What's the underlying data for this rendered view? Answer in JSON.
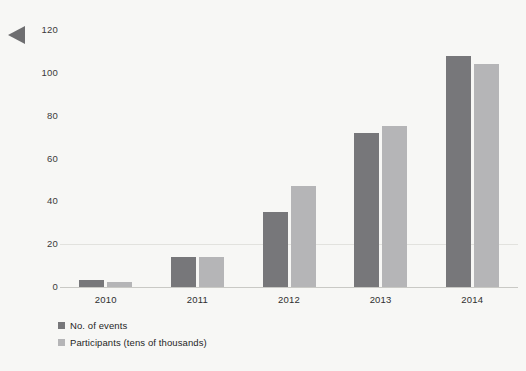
{
  "nav": {
    "prev_arrow_icon": "triangle-left-icon"
  },
  "chart_data": {
    "type": "bar",
    "title": "",
    "subtitle": "",
    "xlabel": "",
    "ylabel": "",
    "categories": [
      "2010",
      "2011",
      "2012",
      "2013",
      "2014"
    ],
    "series": [
      {
        "name": "No. of events",
        "color": "#77777a",
        "values": [
          3.5,
          14,
          35,
          72,
          108
        ]
      },
      {
        "name": "Participants (tens of thousands)",
        "color": "#b5b5b7",
        "values": [
          2.5,
          14,
          47,
          75,
          104
        ]
      }
    ],
    "ylim": [
      0,
      120
    ],
    "yticks": [
      0,
      20,
      40,
      60,
      80,
      100,
      120
    ],
    "ytick_labels": [
      "0",
      "20",
      "40",
      "60",
      "80",
      "100",
      "120"
    ],
    "grid": true,
    "gridlines_at": [
      20
    ],
    "legend_position": "bottom-left",
    "legend": [
      "No. of events",
      "Participants (tens of thousands)"
    ],
    "background_color": "#f7f7f5"
  }
}
